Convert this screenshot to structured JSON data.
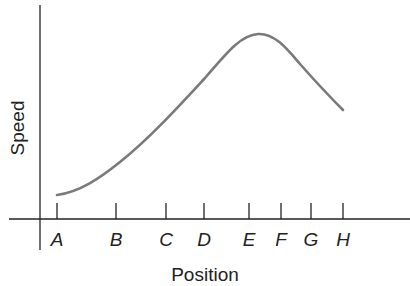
{
  "chart_data": {
    "type": "line",
    "title": "",
    "xlabel": "Position",
    "ylabel": "Speed",
    "categories": [
      "A",
      "B",
      "C",
      "D",
      "E",
      "F",
      "G",
      "H"
    ],
    "series": [
      {
        "name": "Speed",
        "values": [
          0.12,
          0.3,
          0.52,
          0.78,
          1.0,
          0.9,
          0.72,
          0.53
        ]
      }
    ],
    "grid": false,
    "legend": "none",
    "note": "Qualitative curve; y-axis unlabeled numerically (relative values, peak normalized to 1.0 near E)"
  },
  "axes": {
    "x_title": "Position",
    "y_title": "Speed",
    "ticks": [
      "A",
      "B",
      "C",
      "D",
      "E",
      "F",
      "G",
      "H"
    ]
  },
  "colors": {
    "curve": "#7a7a7a",
    "axis": "#222222"
  }
}
